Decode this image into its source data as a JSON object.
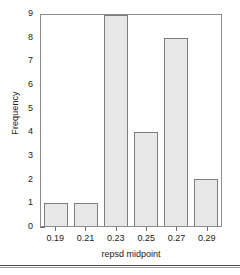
{
  "chart_data": {
    "type": "bar",
    "title": "",
    "xlabel": "repsd midpoint",
    "ylabel": "Frequency",
    "categories": [
      "0.19",
      "0.21",
      "0.23",
      "0.25",
      "0.27",
      "0.29"
    ],
    "values": [
      1,
      1,
      9,
      4,
      8,
      2
    ],
    "ylim": [
      0,
      9
    ],
    "yticks": [
      "0",
      "1",
      "2",
      "3",
      "4",
      "5",
      "6",
      "7",
      "8",
      "9"
    ],
    "y_minor_ticks_per_interval": 4,
    "grid": false,
    "legend": null,
    "bar_fill_color": "#e8e8e8",
    "bar_border_color": "#7d7d7d",
    "frame_color": "#8d8d8d"
  },
  "figure": {
    "background_color": "#ffffff"
  },
  "footer": {
    "ghost_text": ""
  }
}
